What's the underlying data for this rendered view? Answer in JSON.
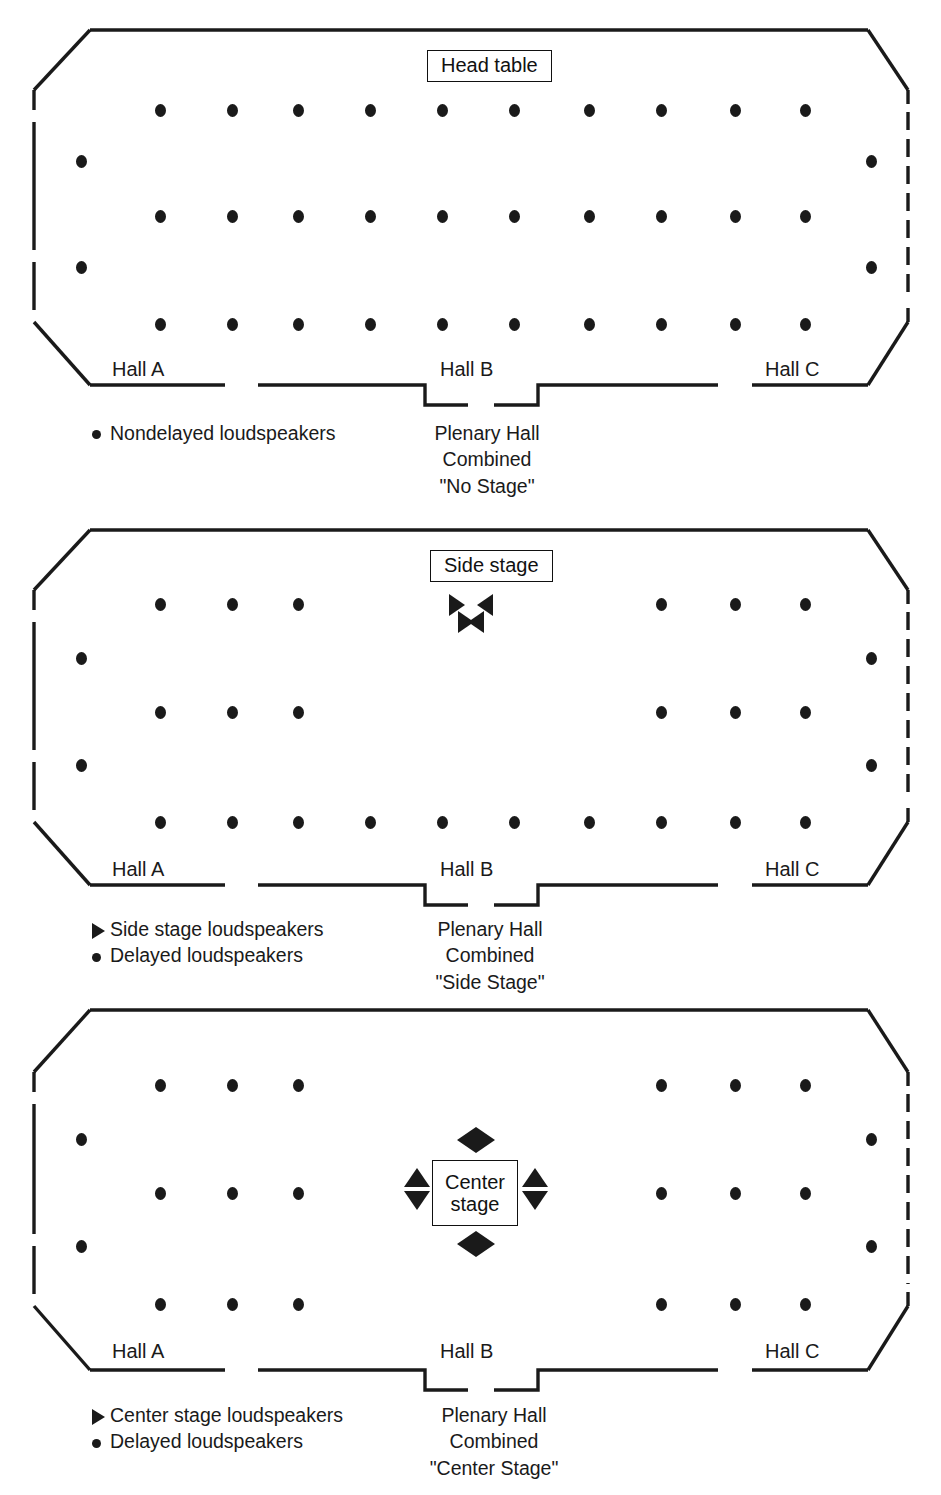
{
  "figure": {
    "type": "floor-plan-diagram"
  },
  "colors": {
    "ink": "#1a1a1a",
    "background": "#ffffff"
  },
  "hall_labels": [
    "Hall A",
    "Hall B",
    "Hall C"
  ],
  "panels": [
    {
      "id": "no-stage",
      "stage_box": {
        "label": "Head table",
        "shape": "wide"
      },
      "plenary_caption": [
        "Plenary Hall",
        "Combined",
        "\"No Stage\""
      ],
      "legend": [
        {
          "glyph": "dot",
          "label": "Nondelayed loudspeakers"
        }
      ],
      "speaker_rows": {
        "row_1_count": 10,
        "row_2_count": 10,
        "row_3_count": 10,
        "left_wall_count": 2,
        "right_wall_count": 2
      },
      "stage_loudspeakers": []
    },
    {
      "id": "side-stage",
      "stage_box": {
        "label": "Side stage",
        "shape": "wide"
      },
      "plenary_caption": [
        "Plenary Hall",
        "Combined",
        "\"Side Stage\""
      ],
      "legend": [
        {
          "glyph": "triangle",
          "label": "Side stage loudspeakers"
        },
        {
          "glyph": "dot",
          "label": "Delayed loudspeakers"
        }
      ],
      "speaker_rows": {
        "row_1_count": 6,
        "row_2_count": 6,
        "row_3_count": 10,
        "left_wall_count": 2,
        "right_wall_count": 2
      },
      "stage_loudspeakers": [
        "right",
        "left",
        "right",
        "left"
      ]
    },
    {
      "id": "center-stage",
      "stage_box": {
        "label_line_1": "Center",
        "label_line_2": "stage",
        "shape": "square"
      },
      "plenary_caption": [
        "Plenary Hall",
        "Combined",
        "\"Center Stage\""
      ],
      "legend": [
        {
          "glyph": "triangle",
          "label": "Center stage loudspeakers"
        },
        {
          "glyph": "dot",
          "label": "Delayed loudspeakers"
        }
      ],
      "speaker_rows": {
        "row_1_count": 6,
        "row_2_count": 6,
        "row_3_count": 6,
        "left_wall_count": 2,
        "right_wall_count": 2
      },
      "stage_loudspeakers": [
        "left",
        "right",
        "up",
        "down",
        "up",
        "down",
        "left",
        "right"
      ]
    }
  ]
}
